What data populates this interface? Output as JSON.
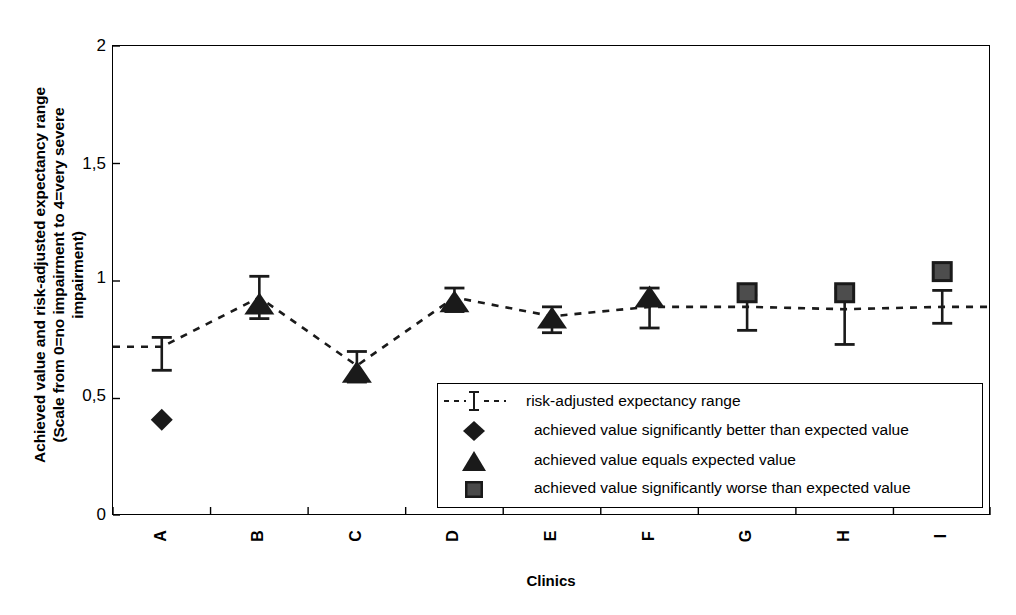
{
  "chart_data": {
    "type": "scatter",
    "title": "",
    "xlabel": "Clinics",
    "ylabel": "Achieved value and risk-adjusted expectancy range\n(Scale from 0=no impairment to 4=very severe\nimpairment)",
    "categories": [
      "A",
      "B",
      "C",
      "D",
      "E",
      "F",
      "G",
      "H",
      "I"
    ],
    "ylim": [
      0,
      2
    ],
    "yticks": [
      0,
      0.5,
      1,
      1.5,
      2
    ],
    "ytick_labels": [
      "0",
      "0,5",
      "1",
      "1,5",
      "2"
    ],
    "grid": false,
    "legend_position": "inside-bottom-center",
    "series": [
      {
        "name": "risk-adjusted expectancy range",
        "marker": "errorbar-dashed-line",
        "values": [
          0.72,
          0.93,
          0.64,
          0.93,
          0.85,
          0.89,
          0.89,
          0.88,
          0.89
        ],
        "err_low": [
          0.62,
          0.84,
          0.57,
          0.87,
          0.78,
          0.8,
          0.79,
          0.73,
          0.82
        ],
        "err_high": [
          0.76,
          1.02,
          0.7,
          0.97,
          0.89,
          0.97,
          0.94,
          0.97,
          0.96
        ]
      },
      {
        "name": "achieved value",
        "marker": "per-point",
        "values": [
          0.41,
          0.9,
          0.61,
          0.91,
          0.84,
          0.93,
          0.95,
          0.95,
          1.04
        ],
        "markers": [
          "diamond",
          "triangle",
          "triangle",
          "triangle",
          "triangle",
          "triangle",
          "square",
          "square",
          "square"
        ]
      }
    ],
    "legend": [
      {
        "symbol": "errorbar",
        "label": "risk-adjusted expectancy range"
      },
      {
        "symbol": "diamond",
        "label": "achieved value significantly better than expected value"
      },
      {
        "symbol": "triangle",
        "label": "achieved value equals expected value"
      },
      {
        "symbol": "square",
        "label": "achieved value significantly worse than expected value"
      }
    ],
    "colors": {
      "series": "#1a1a1a",
      "axis": "#000000",
      "background": "#ffffff"
    }
  },
  "axes": {
    "y_title": "Achieved value and risk-adjusted expectancy range\n(Scale from 0=no impairment to 4=very severe\nimpairment)",
    "x_title": "Clinics",
    "y_tick_labels": [
      "2",
      "1,5",
      "1",
      "0,5",
      "0"
    ],
    "x_tick_labels": [
      "A",
      "B",
      "C",
      "D",
      "E",
      "F",
      "G",
      "H",
      "I"
    ]
  },
  "legend": {
    "rows": [
      {
        "label": "risk-adjusted expectancy range"
      },
      {
        "label": "achieved value significantly better than expected value"
      },
      {
        "label": "achieved value equals expected value"
      },
      {
        "label": "achieved value significantly worse than expected value"
      }
    ]
  }
}
